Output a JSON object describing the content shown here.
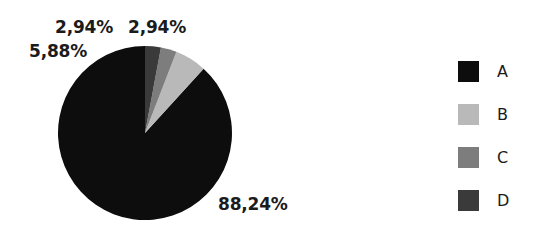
{
  "chart_data": {
    "type": "pie",
    "title": "",
    "categories": [
      "A",
      "B",
      "C",
      "D"
    ],
    "values": [
      88.24,
      5.88,
      2.94,
      2.94
    ],
    "value_labels": [
      "88,24%",
      "5,88%",
      "2,94%",
      "2,94%"
    ],
    "colors": [
      "#0d0d0d",
      "#b9b9b9",
      "#7d7d7d",
      "#3a3a3a"
    ],
    "legend_position": "right",
    "grid": false,
    "start_angle_deg": 90,
    "direction": "counterclockwise",
    "labels_outside": true
  },
  "legend": {
    "items": [
      {
        "label": "A",
        "color": "#0d0d0d"
      },
      {
        "label": "B",
        "color": "#b9b9b9"
      },
      {
        "label": "C",
        "color": "#7d7d7d"
      },
      {
        "label": "D",
        "color": "#3a3a3a"
      }
    ]
  },
  "slice_labels": {
    "a": "88,24%",
    "b": "5,88%",
    "c": "2,94%",
    "d": "2,94%"
  }
}
